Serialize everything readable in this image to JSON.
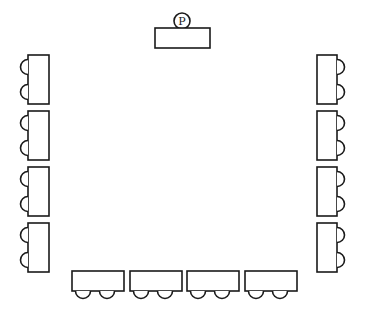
{
  "diagram": {
    "title": "",
    "podium": {
      "label": "P",
      "chairs": 1
    },
    "left_tables": [
      {
        "id": "L1",
        "chairs": 2
      },
      {
        "id": "L2",
        "chairs": 2
      },
      {
        "id": "L3",
        "chairs": 2
      },
      {
        "id": "L4",
        "chairs": 2
      }
    ],
    "right_tables": [
      {
        "id": "R1",
        "chairs": 2
      },
      {
        "id": "R2",
        "chairs": 2
      },
      {
        "id": "R3",
        "chairs": 2
      },
      {
        "id": "R4",
        "chairs": 2
      }
    ],
    "bottom_tables": [
      {
        "id": "B1",
        "chairs": 2
      },
      {
        "id": "B2",
        "chairs": 2
      },
      {
        "id": "B3",
        "chairs": 2
      },
      {
        "id": "B4",
        "chairs": 2
      }
    ],
    "colors": {
      "stroke": "#1a1a1a",
      "fill": "#ffffff"
    }
  }
}
